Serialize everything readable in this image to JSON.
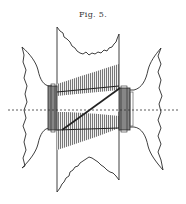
{
  "figure": {
    "caption": "Fig. 5.",
    "colors": {
      "ink": "#2a2a2a",
      "background": "#ffffff",
      "hatch": "#555555"
    },
    "elements": [
      "upper-torn-sheet",
      "lower-torn-sheet",
      "left-bell-profile",
      "right-bell-profile",
      "left-coil",
      "right-coil",
      "upper-thread-band",
      "lower-thread-band",
      "diagonal-thread",
      "center-axis-dashed"
    ]
  }
}
